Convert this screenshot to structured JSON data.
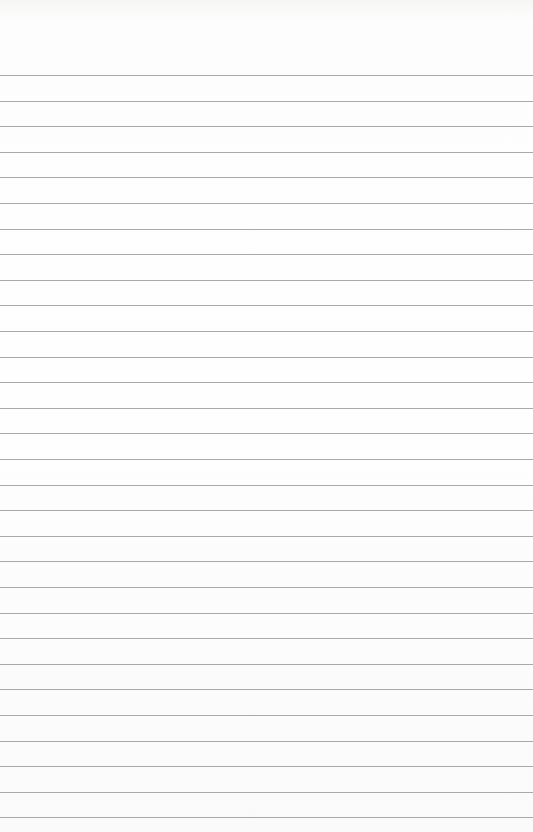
{
  "image": {
    "description": "Blank sheet of ruled (lined) paper",
    "background_color": "#fdfdfd",
    "rule_color": "#a9a9a9",
    "rule_count": 30,
    "first_rule_y": 75,
    "rule_spacing": 25.6,
    "text": []
  }
}
